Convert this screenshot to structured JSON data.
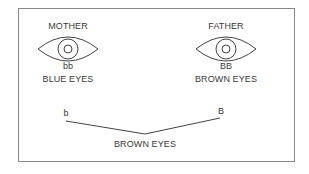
{
  "mother": {
    "title": "MOTHER",
    "genotype": "bb",
    "phenotype": "BLUE EYES"
  },
  "father": {
    "title": "FATHER",
    "genotype": "BB",
    "phenotype": "BROWN EYES"
  },
  "offspring": {
    "allele_left": "b",
    "allele_right": "B",
    "phenotype": "BROWN EYES"
  }
}
